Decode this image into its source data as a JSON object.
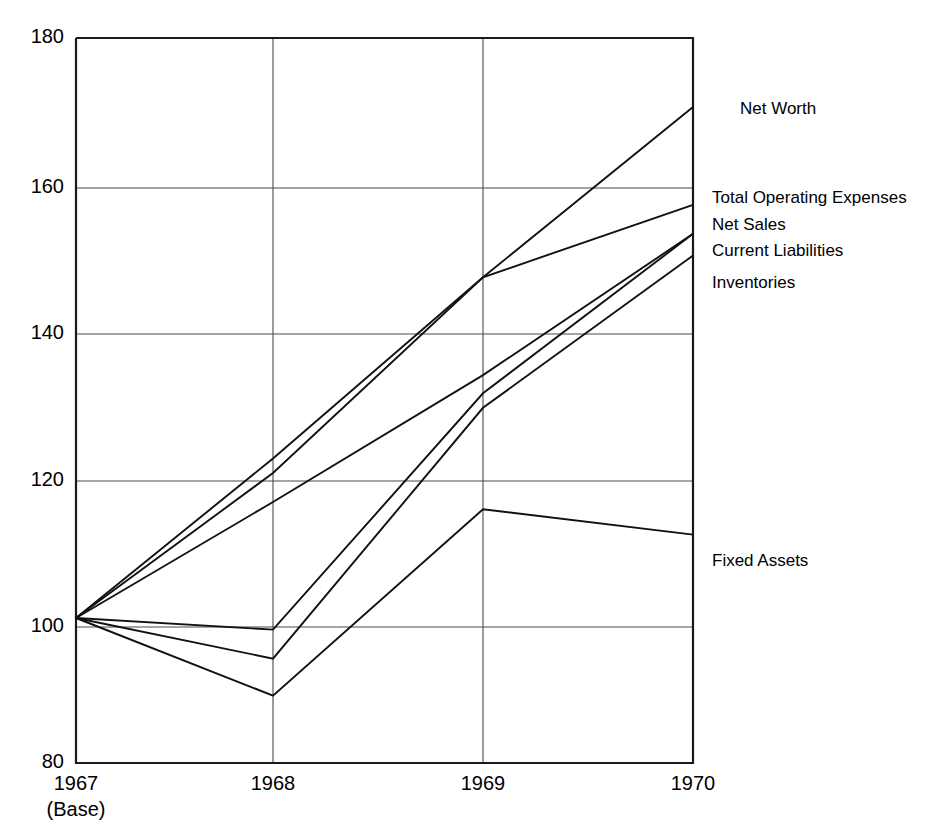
{
  "chart_data": {
    "type": "line",
    "title": "",
    "subtitle": "",
    "xlabel": "",
    "ylabel": "",
    "categories": [
      "1967",
      "1968",
      "1969",
      "1970"
    ],
    "x_tick_labels": [
      "1967",
      "1968",
      "1969",
      "1970"
    ],
    "x_tick_sublabels": [
      "(Base)",
      "",
      "",
      ""
    ],
    "y_tick_labels": [
      "180",
      "160",
      "140",
      "120",
      "100",
      "80"
    ],
    "y_ticks": [
      180,
      160,
      140,
      120,
      100,
      80
    ],
    "ylim": [
      80,
      180
    ],
    "xlim": [
      "1967",
      "1970"
    ],
    "grid": true,
    "legend": "inline-right-end-labels",
    "series": [
      {
        "name": "Net Worth",
        "label": "Net Worth",
        "values": [
          100,
          122,
          147,
          170.5
        ],
        "label_y_value": 171
      },
      {
        "name": "Total Operating Expenses",
        "label": "Total Operating Expenses",
        "values": [
          100,
          120,
          147,
          157
        ],
        "label_y_value": 159
      },
      {
        "name": "Net Sales",
        "label": "Net Sales",
        "values": [
          100,
          116,
          133.5,
          153
        ],
        "label_y_value": 153.5
      },
      {
        "name": "Current Liabilities",
        "label": "Current Liabilities",
        "values": [
          100,
          98.4,
          131,
          153
        ],
        "label_y_value": 149.5
      },
      {
        "name": "Inventories",
        "label": "Inventories",
        "values": [
          100,
          94.4,
          129,
          150
        ],
        "label_y_value": 145
      },
      {
        "name": "Fixed Assets",
        "label": "Fixed Assets",
        "values": [
          100,
          89.3,
          115,
          111.5
        ],
        "label_y_value": 111.5
      }
    ],
    "label_x_value": 1970.1
  }
}
